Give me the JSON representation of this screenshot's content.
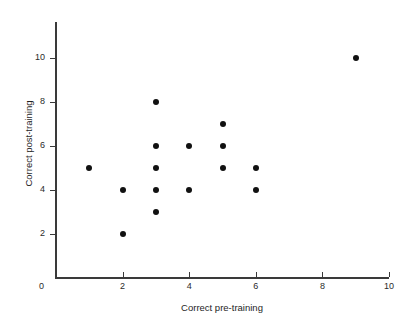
{
  "chart_data": {
    "type": "scatter",
    "title": "",
    "xlabel": "Correct pre-training",
    "ylabel": "Correct post-training",
    "xlim": [
      0,
      10
    ],
    "ylim": [
      0,
      11.6
    ],
    "grid": false,
    "legend": null,
    "x_ticks": [
      0,
      2,
      4,
      6,
      8,
      10
    ],
    "y_ticks": [
      0,
      2,
      4,
      6,
      8,
      10
    ],
    "x_tick_labels": [
      "0",
      "2",
      "4",
      "6",
      "8",
      "10"
    ],
    "y_tick_labels": [
      "0",
      "2",
      "4",
      "6",
      "8",
      "10"
    ],
    "origin_label": "0",
    "marker_color": "#111111",
    "axis_color": "#3a3a3a",
    "points": [
      {
        "x": 1,
        "y": 5
      },
      {
        "x": 2,
        "y": 4
      },
      {
        "x": 2,
        "y": 2
      },
      {
        "x": 3,
        "y": 8
      },
      {
        "x": 3,
        "y": 6
      },
      {
        "x": 3,
        "y": 5
      },
      {
        "x": 3,
        "y": 4
      },
      {
        "x": 3,
        "y": 3
      },
      {
        "x": 4,
        "y": 6
      },
      {
        "x": 4,
        "y": 4
      },
      {
        "x": 5,
        "y": 7
      },
      {
        "x": 5,
        "y": 6
      },
      {
        "x": 5,
        "y": 5
      },
      {
        "x": 6,
        "y": 5
      },
      {
        "x": 6,
        "y": 4
      },
      {
        "x": 9,
        "y": 10
      }
    ]
  }
}
